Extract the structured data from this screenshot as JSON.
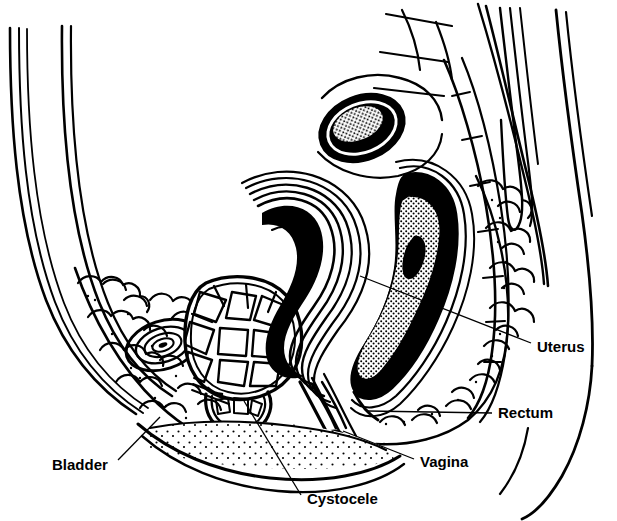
{
  "figure": {
    "style": "black-and-white line art medical illustration",
    "background_color": "#ffffff",
    "ink_color": "#000000",
    "width": 617,
    "height": 521
  },
  "labels": [
    {
      "id": "uterus",
      "text": "Uterus",
      "text_x": 537,
      "text_y": 348,
      "anchor": "start",
      "leader": "M 531 343 L 360 276",
      "points_to": "uterus-body"
    },
    {
      "id": "rectum",
      "text": "Rectum",
      "text_x": 498,
      "text_y": 414,
      "anchor": "start",
      "leader": "M 492 413 L 368 411",
      "points_to": "rectum-organ"
    },
    {
      "id": "vagina",
      "text": "Vagina",
      "text_x": 420,
      "text_y": 463,
      "anchor": "start",
      "leader": "M 414 459 L 343 431",
      "points_to": "vaginal-canal"
    },
    {
      "id": "cystocele",
      "text": "Cystocele",
      "text_x": 307,
      "text_y": 500,
      "anchor": "start",
      "leader": "M 301 495 L 244 401",
      "points_to": "cystocele-bulge"
    },
    {
      "id": "bladder",
      "text": "Bladder",
      "text_x": 52,
      "text_y": 466,
      "anchor": "start",
      "leader": "M 118 460 L 160 417",
      "points_to": "bladder-organ"
    }
  ],
  "anatomy": [
    {
      "id": "abdominal-wall",
      "name": "Anterior abdominal wall"
    },
    {
      "id": "pubic-symphysis",
      "name": "Pubic symphysis"
    },
    {
      "id": "bladder-organ",
      "name": "Urinary bladder with trabeculated wall"
    },
    {
      "id": "cystocele-bulge",
      "name": "Cystocele (bladder prolapse into vagina)"
    },
    {
      "id": "uterus-body",
      "name": "Prolapsed uterus"
    },
    {
      "id": "vaginal-canal",
      "name": "Vaginal canal"
    },
    {
      "id": "rectum-organ",
      "name": "Rectum with fecal content"
    },
    {
      "id": "sacrum-coccyx",
      "name": "Sacrum and coccyx"
    },
    {
      "id": "lumbar-vertebra",
      "name": "Lumbar vertebral body"
    },
    {
      "id": "intervertebral-disc",
      "name": "Intervertebral disc"
    },
    {
      "id": "back-muscles",
      "name": "Paraspinal back muscles"
    },
    {
      "id": "fat-tissue",
      "name": "Subcutaneous and perirectal fatty tissue"
    },
    {
      "id": "perineal-body",
      "name": "Perineal body / mons region"
    },
    {
      "id": "buttock-outline",
      "name": "Buttock contour"
    }
  ]
}
